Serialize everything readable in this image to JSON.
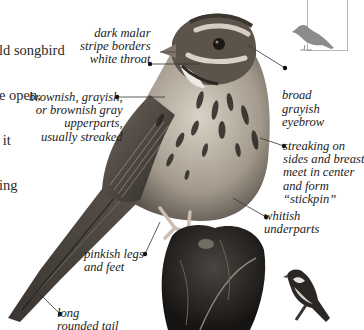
{
  "intro_text": {
    "lines": [
      "ld songbird",
      "e open,",
      " it",
      "ing"
    ]
  },
  "labels": {
    "malar": "dark malar\nstripe borders\nwhite throat",
    "upperparts": "brownish, grayish,\nor brownish gray\nupperparts,\nusually streaked",
    "eyebrow": "broad\ngrayish\neyebrow",
    "streaking": "streaking on\nsides and breast\nmeet in center\nand form\n“stickpin”",
    "underparts": "whitish\nunderparts",
    "legs": "pinkish legs\nand feet",
    "tail": "long\nrounded tail"
  },
  "icons": {
    "silhouette": "perched-bird-silhouette-icon",
    "thumbnail": "sparrow-thumbnail-illustration"
  },
  "colors": {
    "text": "#222222",
    "leader_line": "#333333",
    "silhouette": "#8c8c8c",
    "box_border": "#b8b8b8"
  }
}
